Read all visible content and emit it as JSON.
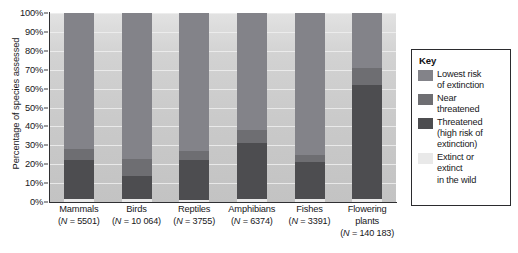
{
  "chart_data": {
    "type": "bar",
    "subtype": "stacked-percentage",
    "title": "",
    "xlabel": "",
    "ylabel": "Percentage of species assessed",
    "ylim": [
      0,
      100
    ],
    "ytick_labels": [
      "0%",
      "10%",
      "20%",
      "30%",
      "40%",
      "50%",
      "60%",
      "70%",
      "80%",
      "90%",
      "100%"
    ],
    "ytick_values": [
      0,
      10,
      20,
      30,
      40,
      50,
      60,
      70,
      80,
      90,
      100
    ],
    "grid": true,
    "legend_position": "right-outside",
    "categories": [
      "Mammals",
      "Birds",
      "Reptiles",
      "Amphibians",
      "Fishes",
      "Flowering plants"
    ],
    "category_counts": [
      "(N = 5501)",
      "(N = 10 064)",
      "(N = 3755)",
      "(N = 6374)",
      "(N = 3391)",
      "(N = 140 183)"
    ],
    "series": [
      {
        "name": "Extinct or extinct in the wild",
        "color": "#e9e9e9",
        "values": [
          1.5,
          1.5,
          1,
          1.5,
          1.5,
          1.5
        ]
      },
      {
        "name": "Threatened (high risk of extinction)",
        "color": "#4d4d50",
        "values": [
          20.5,
          12.5,
          21,
          29.5,
          19.5,
          60.5
        ]
      },
      {
        "name": "Near threatened",
        "color": "#6e6e72",
        "values": [
          6,
          8.5,
          5,
          7,
          4,
          9
        ]
      },
      {
        "name": "Lowest risk of extinction",
        "color": "#838389",
        "values": [
          72,
          77.5,
          73,
          62,
          75,
          29
        ]
      }
    ]
  },
  "legend": {
    "title": "Key",
    "items": [
      {
        "label": "Lowest risk\nof extinction",
        "color": "#838389"
      },
      {
        "label": "Near\nthreatened",
        "color": "#6e6e72"
      },
      {
        "label": "Threatened\n(high risk of\nextinction)",
        "color": "#4d4d50"
      },
      {
        "label": "Extinct or\nextinct\nin the wild",
        "color": "#e9e9e9"
      }
    ]
  }
}
